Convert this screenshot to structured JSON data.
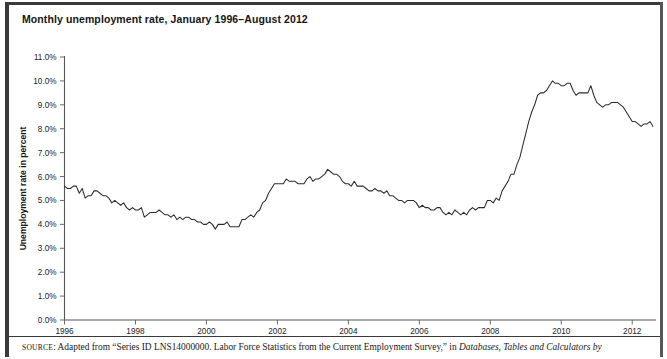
{
  "figure": {
    "title": "Monthly unemployment rate, January 1996–August 2012",
    "source_prefix": "SOURCE",
    "source_body": ": Adapted from “Series ID LNS14000000. Labor Force Statistics from the Current Employment Survey,” in ",
    "source_italic": "Databases, Tables and Calculators by"
  },
  "chart_data": {
    "type": "line",
    "title": "Monthly unemployment rate, January 1996–August 2012",
    "xlabel": "",
    "ylabel": "Unemployment rate in percent",
    "ylim": [
      0,
      11
    ],
    "xlim": [
      1996.0,
      2012.67
    ],
    "grid": false,
    "legend": "none",
    "ytick_labels": [
      "0.0%",
      "1.0%",
      "2.0%",
      "3.0%",
      "4.0%",
      "5.0%",
      "6.0%",
      "7.0%",
      "8.0%",
      "9.0%",
      "10.0%",
      "11.0%"
    ],
    "ytick_values": [
      0,
      1,
      2,
      3,
      4,
      5,
      6,
      7,
      8,
      9,
      10,
      11
    ],
    "xtick_labels": [
      "1996",
      "1998",
      "2000",
      "2002",
      "2004",
      "2006",
      "2008",
      "2010",
      "2012"
    ],
    "xtick_values": [
      1996,
      1998,
      2000,
      2002,
      2004,
      2006,
      2008,
      2010,
      2012
    ],
    "series": [
      {
        "name": "Unemployment rate",
        "color": "#2c2c2e",
        "x_start_year": 1996,
        "x_start_month": 1,
        "x_step_months": 1,
        "values": [
          5.6,
          5.5,
          5.5,
          5.6,
          5.6,
          5.3,
          5.5,
          5.1,
          5.2,
          5.2,
          5.4,
          5.4,
          5.3,
          5.2,
          5.2,
          5.1,
          4.9,
          5.0,
          4.9,
          4.8,
          4.9,
          4.7,
          4.6,
          4.7,
          4.6,
          4.6,
          4.7,
          4.3,
          4.4,
          4.5,
          4.5,
          4.5,
          4.6,
          4.5,
          4.4,
          4.4,
          4.3,
          4.4,
          4.2,
          4.3,
          4.2,
          4.3,
          4.3,
          4.2,
          4.2,
          4.1,
          4.1,
          4.0,
          4.0,
          4.1,
          4.0,
          3.8,
          4.0,
          4.0,
          4.0,
          4.1,
          3.9,
          3.9,
          3.9,
          3.9,
          4.2,
          4.2,
          4.3,
          4.4,
          4.3,
          4.5,
          4.6,
          4.9,
          5.0,
          5.3,
          5.5,
          5.7,
          5.7,
          5.7,
          5.7,
          5.9,
          5.8,
          5.8,
          5.8,
          5.7,
          5.7,
          5.7,
          5.9,
          6.0,
          5.8,
          5.9,
          5.9,
          6.0,
          6.1,
          6.3,
          6.2,
          6.1,
          6.1,
          6.0,
          5.8,
          5.7,
          5.7,
          5.6,
          5.8,
          5.6,
          5.6,
          5.6,
          5.5,
          5.4,
          5.4,
          5.5,
          5.4,
          5.4,
          5.3,
          5.4,
          5.2,
          5.2,
          5.1,
          5.0,
          5.0,
          4.9,
          5.0,
          5.0,
          5.0,
          4.9,
          4.7,
          4.8,
          4.7,
          4.7,
          4.6,
          4.6,
          4.7,
          4.7,
          4.5,
          4.4,
          4.5,
          4.4,
          4.6,
          4.5,
          4.4,
          4.5,
          4.4,
          4.6,
          4.7,
          4.6,
          4.7,
          4.7,
          4.7,
          5.0,
          5.0,
          4.9,
          5.1,
          5.0,
          5.4,
          5.6,
          5.8,
          6.1,
          6.1,
          6.5,
          6.8,
          7.3,
          7.8,
          8.3,
          8.7,
          9.0,
          9.4,
          9.5,
          9.5,
          9.6,
          9.8,
          10.0,
          9.9,
          9.9,
          9.8,
          9.8,
          9.9,
          9.9,
          9.6,
          9.4,
          9.5,
          9.5,
          9.5,
          9.5,
          9.8,
          9.4,
          9.1,
          9.0,
          8.9,
          9.0,
          9.0,
          9.1,
          9.1,
          9.1,
          9.0,
          8.9,
          8.7,
          8.5,
          8.3,
          8.3,
          8.2,
          8.1,
          8.2,
          8.2,
          8.3,
          8.1
        ]
      }
    ]
  }
}
